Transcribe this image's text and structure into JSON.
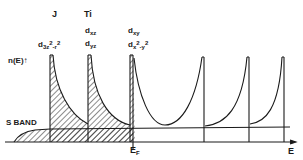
{
  "figure": {
    "y_axis_label": "n(E)",
    "x_axis_label": "E",
    "fermi_label": "E",
    "fermi_sub": "F",
    "s_band_label": "S BAND",
    "site_labels": [
      "J",
      "Ti"
    ],
    "orbitals": {
      "j_main": "d",
      "j_sub": "3z",
      "j_sup": "2",
      "j_sub2": "-r",
      "j_sup2": "2",
      "ti_1_main": "d",
      "ti_1_sub": "xz",
      "ti_2_main": "d",
      "ti_2_sub": "yz",
      "third_1_main": "d",
      "third_1_sub": "xy",
      "third_2_main": "d",
      "third_2_sub": "x",
      "third_2_sup": "2",
      "third_2_sub2": "-y",
      "third_2_sup2": "2"
    },
    "colors": {
      "ink": "#1a1a1a",
      "background": "#ffffff"
    }
  }
}
